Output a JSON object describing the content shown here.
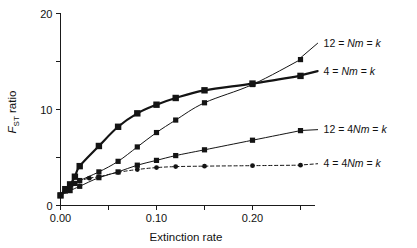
{
  "chart_data": {
    "type": "line",
    "title": "",
    "xlabel": "Extinction rate",
    "ylabel": "FST ratio",
    "ylabel_parts": {
      "main": "F",
      "sub": "ST",
      "tail": " ratio"
    },
    "xlim": [
      -0.005,
      0.265
    ],
    "ylim": [
      0,
      20
    ],
    "xticks": [
      0.0,
      0.05,
      0.1,
      0.15,
      0.2,
      0.25
    ],
    "xtick_labels": [
      "0.00",
      "",
      "0.10",
      "",
      "0.20",
      ""
    ],
    "yticks": [
      0,
      5,
      10,
      15,
      20
    ],
    "ytick_labels": [
      "0",
      "",
      "10",
      "",
      "20"
    ],
    "grid": false,
    "legend_position": "right-inline",
    "series": [
      {
        "name": "12 = Nm = k",
        "label_parts": {
          "lead": "12 = ",
          "ital": "Nm",
          "mid": " = ",
          "ital2": "k"
        },
        "style": "solid-thin",
        "linewidth": 1.0,
        "marker": "square-small",
        "marker_size": 2.6,
        "label_x": 0.272,
        "label_y": 16.9,
        "x": [
          0.0,
          0.005,
          0.01,
          0.015,
          0.02,
          0.04,
          0.06,
          0.08,
          0.1,
          0.12,
          0.15,
          0.2,
          0.25
        ],
        "y": [
          1.05,
          1.5,
          1.9,
          2.3,
          2.6,
          3.5,
          4.6,
          6.1,
          7.6,
          8.9,
          10.7,
          12.6,
          15.2
        ]
      },
      {
        "name": "4 = Nm = k",
        "label_parts": {
          "lead": "4 = ",
          "ital": "Nm",
          "mid": " = ",
          "ital2": "k"
        },
        "style": "solid-thick",
        "linewidth": 2.2,
        "marker": "square-large",
        "marker_size": 3.2,
        "label_x": 0.272,
        "label_y": 14.0,
        "x": [
          0.0,
          0.005,
          0.01,
          0.015,
          0.02,
          0.04,
          0.06,
          0.08,
          0.1,
          0.12,
          0.15,
          0.2,
          0.25
        ],
        "y": [
          1.05,
          1.7,
          2.2,
          3.0,
          4.1,
          6.2,
          8.2,
          9.6,
          10.5,
          11.2,
          12.0,
          12.7,
          13.5
        ]
      },
      {
        "name": "12 = 4Nm = k",
        "label_parts": {
          "lead": "12 = 4",
          "ital": "Nm",
          "mid": " = ",
          "ital2": "k"
        },
        "style": "solid-thin",
        "linewidth": 1.0,
        "marker": "square-small",
        "marker_size": 2.6,
        "label_x": 0.272,
        "label_y": 7.9,
        "x": [
          0.0,
          0.01,
          0.02,
          0.04,
          0.06,
          0.08,
          0.1,
          0.12,
          0.15,
          0.2,
          0.25
        ],
        "y": [
          1.05,
          1.55,
          2.0,
          2.9,
          3.5,
          4.2,
          4.7,
          5.2,
          5.8,
          6.8,
          7.8
        ]
      },
      {
        "name": "4 = 4Nm = k",
        "label_parts": {
          "lead": "4 = 4",
          "ital": "Nm",
          "mid": " = ",
          "ital2": "k"
        },
        "style": "dashed",
        "linewidth": 1.0,
        "marker": "circle-small",
        "marker_size": 2.4,
        "label_x": 0.272,
        "label_y": 4.35,
        "x": [
          0.0,
          0.01,
          0.02,
          0.03,
          0.04,
          0.06,
          0.08,
          0.1,
          0.12,
          0.15,
          0.2,
          0.25
        ],
        "y": [
          1.05,
          2.0,
          2.55,
          2.85,
          3.0,
          3.45,
          3.75,
          3.95,
          4.05,
          4.1,
          4.15,
          4.2
        ]
      }
    ]
  }
}
